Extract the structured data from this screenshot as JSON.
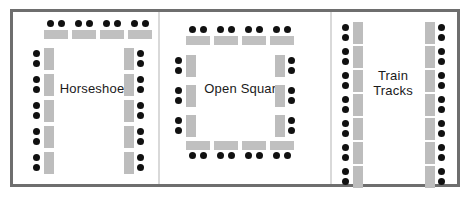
{
  "diagram": {
    "background_color": "#ffffff",
    "frame_color": "#6e6e6e",
    "divider_color": "#d9d9d9",
    "table_color": "#c0c0c0",
    "chair_color": "#111111",
    "panel_count": 3
  },
  "panels": [
    {
      "id": "horseshoe",
      "label": "Horseshoe",
      "label_lines": [
        "Horseshoe"
      ],
      "groups": [
        {
          "name": "top-row",
          "orientation": "horizontal",
          "tables": 4,
          "chairs_per_table": 2,
          "chair_side": "top"
        },
        {
          "name": "left-column",
          "orientation": "vertical",
          "tables": 5,
          "chairs_per_table": 2,
          "chair_side": "left"
        },
        {
          "name": "right-column",
          "orientation": "vertical",
          "tables": 5,
          "chairs_per_table": 2,
          "chair_side": "right"
        }
      ],
      "total_tables": 14,
      "total_chairs": 28
    },
    {
      "id": "open-square",
      "label": "Open Square",
      "label_lines": [
        "Open Square"
      ],
      "groups": [
        {
          "name": "top-row",
          "orientation": "horizontal",
          "tables": 4,
          "chairs_per_table": 2,
          "chair_side": "top"
        },
        {
          "name": "bottom-row",
          "orientation": "horizontal",
          "tables": 4,
          "chairs_per_table": 2,
          "chair_side": "bottom"
        },
        {
          "name": "left-column",
          "orientation": "vertical",
          "tables": 3,
          "chairs_per_table": 2,
          "chair_side": "left"
        },
        {
          "name": "right-column",
          "orientation": "vertical",
          "tables": 3,
          "chairs_per_table": 2,
          "chair_side": "right"
        }
      ],
      "total_tables": 14,
      "total_chairs": 28
    },
    {
      "id": "train-tracks",
      "label": "Train Tracks",
      "label_lines": [
        "Train",
        "Tracks"
      ],
      "groups": [
        {
          "name": "left-column",
          "orientation": "vertical",
          "tables": 7,
          "chairs_per_table": 2,
          "chair_side": "left"
        },
        {
          "name": "right-column",
          "orientation": "vertical",
          "tables": 7,
          "chairs_per_table": 2,
          "chair_side": "right"
        }
      ],
      "total_tables": 14,
      "total_chairs": 28
    }
  ],
  "geometry": {
    "frame": {
      "left": 10,
      "top": 9,
      "width": 450,
      "height": 178,
      "border": 3
    },
    "dividers": [
      {
        "x": 158
      },
      {
        "x": 330
      }
    ],
    "panel_bounds": [
      {
        "id": "horseshoe",
        "left": 13,
        "width": 145
      },
      {
        "id": "open-square",
        "left": 160,
        "width": 170
      },
      {
        "id": "train-tracks",
        "left": 332,
        "width": 125
      }
    ],
    "chair_diameter": 7,
    "table_h": {
      "width": 24,
      "height": 9
    },
    "table_v": {
      "width": 10,
      "height": 22
    },
    "labels": [
      {
        "id": "horseshoe",
        "left": 52,
        "top": 81,
        "width": 80
      },
      {
        "id": "open-square",
        "left": 198,
        "top": 81,
        "width": 92
      },
      {
        "id": "train-tracks",
        "left": 362,
        "top": 68,
        "width": 62
      }
    ],
    "horseshoe": {
      "top_row": {
        "y_table": 30,
        "y_chair": 20,
        "xs": [
          44,
          72,
          100,
          128
        ]
      },
      "left_column": {
        "x_table": 44,
        "x_chair": 33,
        "ys": [
          48,
          74,
          100,
          126,
          152
        ]
      },
      "right_column": {
        "x_table": 124,
        "x_chair": 137,
        "ys": [
          48,
          74,
          100,
          126,
          152
        ]
      }
    },
    "open_square": {
      "top_row": {
        "y_table": 36,
        "y_chair": 26,
        "xs": [
          186,
          214,
          242,
          270
        ]
      },
      "bottom_row": {
        "y_table": 141,
        "y_chair": 152,
        "xs": [
          186,
          214,
          242,
          270
        ]
      },
      "left_column": {
        "x_table": 186,
        "x_chair": 175,
        "ys": [
          55,
          85,
          115
        ]
      },
      "right_column": {
        "x_table": 275,
        "x_chair": 288,
        "ys": [
          55,
          85,
          115
        ]
      }
    },
    "train_tracks": {
      "left_column": {
        "x_table": 353,
        "x_chair": 342,
        "ys": [
          22,
          46,
          70,
          94,
          118,
          142,
          166
        ]
      },
      "right_column": {
        "x_table": 425,
        "x_chair": 438,
        "ys": [
          22,
          46,
          70,
          94,
          118,
          142,
          166
        ]
      }
    }
  }
}
